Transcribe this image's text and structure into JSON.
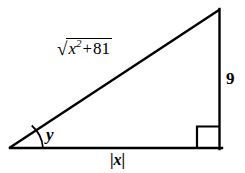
{
  "figure": {
    "background_color": "#ffffff",
    "stroke_color": "#000000",
    "stroke_width": 2,
    "geometry": {
      "left_vertex": [
        10,
        148
      ],
      "right_angle_vertex": [
        219,
        148
      ],
      "top_vertex": [
        219,
        10
      ],
      "right_angle_marker_size": 22,
      "angle_arc_radius": 33
    },
    "labels": {
      "hypotenuse": {
        "radical_sign": "√",
        "variable": "x",
        "exponent": "2",
        "operator": "+",
        "constant": "81",
        "full_text": "√(x² + 81)"
      },
      "vertical_leg": "9",
      "horizontal_leg": {
        "left_bar": "|",
        "variable": "x",
        "right_bar": "|",
        "full_text": "|x|"
      },
      "angle": "y"
    }
  }
}
